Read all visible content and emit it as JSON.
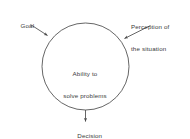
{
  "diagram": {
    "stroke_color": "#4a4a4a",
    "text_color": "#3a3a3a",
    "background_color": "#ffffff",
    "central_node": {
      "shape": "circle",
      "line_1": "Ability to",
      "line_2": "solve problems"
    },
    "inputs": [
      {
        "name": "goal",
        "label": "Goal",
        "arrow_direction": "down-right"
      },
      {
        "name": "perception",
        "line_1": "Perception of",
        "line_2": "the situation",
        "arrow_direction": "down-left"
      }
    ],
    "output": {
      "name": "decision",
      "label": "Decision",
      "arrow_direction": "down"
    }
  }
}
